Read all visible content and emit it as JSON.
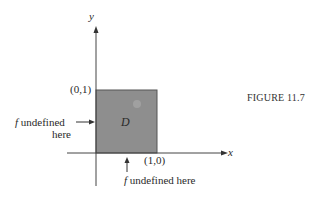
{
  "figure": {
    "caption": "FIGURE 11.7",
    "region_label": "D",
    "axes": {
      "x_label": "x",
      "y_label": "y"
    },
    "points": {
      "top_left": "(0,1)",
      "bottom_right": "(1,0)"
    },
    "annotations": {
      "left": {
        "f": "f",
        "line1": " undefined",
        "line2": "here"
      },
      "bottom": {
        "f": "f",
        "text": " undefined here"
      }
    },
    "colors": {
      "region_fill": "#8e8e8e",
      "region_edge": "#555555",
      "axis": "#444444",
      "background": "#ffffff"
    }
  }
}
